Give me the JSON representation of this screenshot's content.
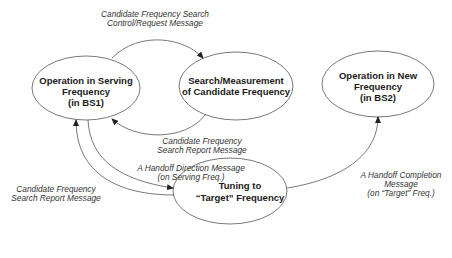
{
  "diagram": {
    "type": "state-transition",
    "states": [
      {
        "id": "serving",
        "lines": [
          "Operation in Serving",
          "Frequency",
          "(in BS1)"
        ]
      },
      {
        "id": "search",
        "lines": [
          "Search/Measurement",
          "of Candidate Frequency"
        ]
      },
      {
        "id": "new",
        "lines": [
          "Operation in New",
          "Frequency",
          "(in BS2)"
        ]
      },
      {
        "id": "tuning",
        "lines": [
          "Tuning to",
          "“Target” Frequency"
        ]
      }
    ],
    "transitions": [
      {
        "from": "serving",
        "to": "search",
        "lines": [
          "Candidate Frequency Search",
          "Control/Request Message"
        ]
      },
      {
        "from": "search",
        "to": "serving",
        "lines": [
          "Candidate Frequency",
          "Search Report Message"
        ]
      },
      {
        "from": "serving",
        "to": "tuning",
        "lines": [
          "A Handoff Direction Message",
          "(on Serving Freq.)"
        ]
      },
      {
        "from": "tuning",
        "to": "serving",
        "lines": [
          "Candidate Frequency",
          "Search Report Message"
        ]
      },
      {
        "from": "tuning",
        "to": "new",
        "lines": [
          "A Handoff Completion",
          "Message",
          "(on “Target” Freq.)"
        ]
      }
    ],
    "colors": {
      "stroke": "#555555",
      "text": "#1a1a1a",
      "background": "#ffffff"
    }
  }
}
